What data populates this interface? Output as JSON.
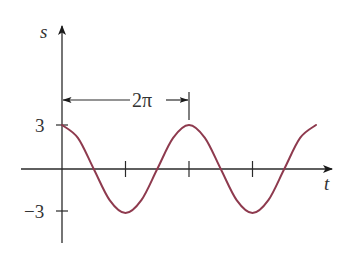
{
  "chart_data": {
    "type": "line",
    "title": "",
    "xlabel": "t",
    "ylabel": "s",
    "function_description": "s = 3 cos t",
    "amplitude": 3,
    "period_label": "2π",
    "ytick_labels": [
      "3",
      "−3"
    ],
    "yticks": [
      3,
      -3
    ],
    "xticks_multiples_of_pi": [
      1,
      2,
      3
    ],
    "xlim_multiples_of_pi": [
      0,
      4
    ],
    "ylim": [
      -3,
      3
    ],
    "grid": false,
    "legend": null,
    "series": [
      {
        "name": "s(t)",
        "color": "#8e3a4e",
        "x_multiples_of_pi": [
          0,
          0.25,
          0.5,
          0.75,
          1,
          1.25,
          1.5,
          1.75,
          2,
          2.25,
          2.5,
          2.75,
          3,
          3.25,
          3.5,
          3.75,
          4
        ],
        "values": [
          3,
          2.12,
          0,
          -2.12,
          -3,
          -2.12,
          0,
          2.12,
          3,
          2.12,
          0,
          -2.12,
          -3,
          -2.12,
          0,
          2.12,
          3
        ]
      }
    ]
  },
  "labels": {
    "y_axis": "s",
    "x_axis": "t",
    "y_max": "3",
    "y_min": "−3",
    "period": "2π"
  }
}
